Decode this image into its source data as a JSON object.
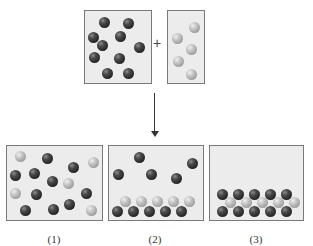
{
  "reactants": {
    "left_box": {
      "ball_type": "dark",
      "count": 10,
      "balls": [
        [
          104,
          22
        ],
        [
          128,
          23
        ],
        [
          93,
          37
        ],
        [
          120,
          36
        ],
        [
          102,
          45
        ],
        [
          139,
          47
        ],
        [
          94,
          57
        ],
        [
          119,
          58
        ],
        [
          107,
          73
        ],
        [
          128,
          73
        ]
      ]
    },
    "operator": "+",
    "right_box": {
      "ball_type": "light",
      "count": 5,
      "balls": [
        [
          194,
          27
        ],
        [
          177,
          38
        ],
        [
          191,
          49
        ],
        [
          178,
          61
        ],
        [
          191,
          74
        ]
      ]
    }
  },
  "arrow": {
    "direction": "down"
  },
  "products": [
    {
      "label": "(1)",
      "balls": [
        [
          "light",
          20,
          156
        ],
        [
          "dark",
          47,
          158
        ],
        [
          "dark",
          73,
          167
        ],
        [
          "light",
          93,
          162
        ],
        [
          "dark",
          15,
          175
        ],
        [
          "dark",
          34,
          173
        ],
        [
          "dark",
          52,
          181
        ],
        [
          "light",
          68,
          183
        ],
        [
          "light",
          15,
          193
        ],
        [
          "dark",
          36,
          194
        ],
        [
          "dark",
          86,
          193
        ],
        [
          "dark",
          25,
          210
        ],
        [
          "dark",
          53,
          209
        ],
        [
          "dark",
          69,
          204
        ],
        [
          "light",
          91,
          210
        ]
      ]
    },
    {
      "label": "(2)",
      "balls": [
        [
          "dark",
          139,
          157
        ],
        [
          "dark",
          192,
          163
        ],
        [
          "dark",
          118,
          174
        ],
        [
          "dark",
          151,
          174
        ],
        [
          "dark",
          176,
          178
        ],
        [
          "light",
          125,
          201
        ],
        [
          "light",
          141,
          201
        ],
        [
          "light",
          157,
          201
        ],
        [
          "light",
          173,
          201
        ],
        [
          "light",
          189,
          201
        ],
        [
          "dark",
          117,
          211
        ],
        [
          "dark",
          133,
          211
        ],
        [
          "dark",
          149,
          211
        ],
        [
          "dark",
          165,
          211
        ],
        [
          "dark",
          181,
          211
        ]
      ]
    },
    {
      "label": "(3)",
      "balls": [
        [
          "dark",
          222,
          194
        ],
        [
          "dark",
          238,
          194
        ],
        [
          "dark",
          254,
          194
        ],
        [
          "dark",
          270,
          194
        ],
        [
          "dark",
          286,
          194
        ],
        [
          "light",
          230,
          202
        ],
        [
          "light",
          246,
          202
        ],
        [
          "light",
          262,
          202
        ],
        [
          "light",
          278,
          202
        ],
        [
          "light",
          294,
          202
        ],
        [
          "dark",
          222,
          211
        ],
        [
          "dark",
          238,
          211
        ],
        [
          "dark",
          254,
          211
        ],
        [
          "dark",
          270,
          211
        ],
        [
          "dark",
          286,
          211
        ]
      ]
    }
  ],
  "colors": {
    "dark_ball": "#2a2a2a",
    "light_ball": "#b8b8b8",
    "box_fill": "#ececec",
    "box_border": "#7a7a7a"
  }
}
